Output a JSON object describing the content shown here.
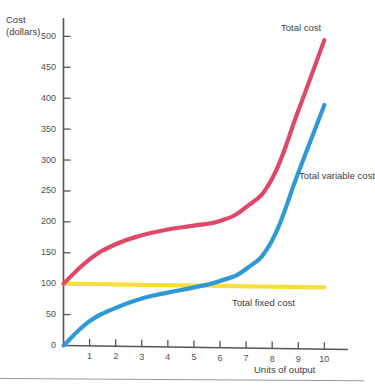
{
  "chart_data": {
    "type": "line",
    "title": "",
    "xlabel": "Units of output",
    "ylabel": "Cost\n(dollars)",
    "xlim": [
      0,
      10.6
    ],
    "ylim": [
      0,
      520
    ],
    "grid": false,
    "legend_position": "inline-right",
    "x_ticks": [
      "1",
      "2",
      "3",
      "4",
      "5",
      "6",
      "7",
      "8",
      "9",
      "10"
    ],
    "x_tick_values": [
      1,
      2,
      3,
      4,
      5,
      6,
      7,
      8,
      9,
      10
    ],
    "y_ticks": [
      "0",
      "50",
      "100",
      "150",
      "200",
      "250",
      "300",
      "350",
      "400",
      "450",
      "500"
    ],
    "y_tick_values": [
      0,
      50,
      100,
      150,
      200,
      250,
      300,
      350,
      400,
      450,
      500
    ],
    "x": [
      0,
      1,
      2,
      3,
      4,
      5,
      6,
      7,
      8,
      9,
      10
    ],
    "series": [
      {
        "name": "Total cost",
        "color": "#e0486a",
        "values": [
          100,
          140,
          165,
          180,
          190,
          197,
          205,
          228,
          275,
          385,
          500
        ]
      },
      {
        "name": "Total variable cost",
        "color": "#2f99d6",
        "values": [
          0,
          40,
          62,
          78,
          88,
          97,
          108,
          128,
          175,
          285,
          395
        ]
      },
      {
        "name": "Total fixed cost",
        "color": "#f7de3c",
        "values": [
          100,
          100,
          100,
          100,
          100,
          100,
          100,
          100,
          100,
          100,
          100
        ]
      }
    ],
    "annotations": [
      {
        "text": "Total\ncost",
        "label_id": "total-cost"
      },
      {
        "text": "Total\nvariable\ncost",
        "label_id": "total-variable-cost"
      },
      {
        "text": "Total fixed cost",
        "label_id": "total-fixed-cost"
      }
    ],
    "axis_color": "#555555",
    "text_color": "#4a4a4a"
  }
}
